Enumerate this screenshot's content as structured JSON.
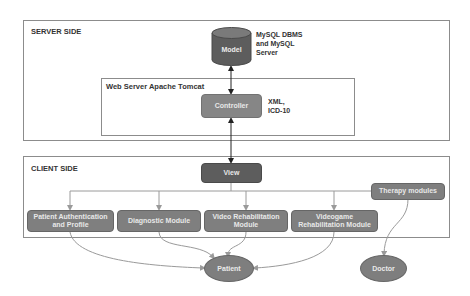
{
  "server": {
    "label": "SERVER SIDE",
    "web_server_label": "Web Server Apache Tomcat",
    "model": {
      "label": "Model",
      "note_lines": [
        "MySQL DBMS",
        "and MySQL",
        "Server"
      ]
    },
    "controller": {
      "label": "Controller",
      "note_lines": [
        "XML,",
        "ICD-10"
      ]
    }
  },
  "client": {
    "label": "CLIENT SIDE",
    "view": {
      "label": "View"
    },
    "therapy": {
      "label": "Therapy modules"
    },
    "modules": [
      {
        "label_lines": [
          "Patient Authentication",
          "and Profile"
        ]
      },
      {
        "label_lines": [
          "Diagnostic Module"
        ]
      },
      {
        "label_lines": [
          "Video Rehabilitation",
          "Module"
        ]
      },
      {
        "label_lines": [
          "Videogame",
          "Rehabilitation Module"
        ]
      }
    ]
  },
  "actors": {
    "patient": "Patient",
    "doctor": "Doctor"
  },
  "colors": {
    "dark_node": "#5d5d5d",
    "mid_node": "#868686",
    "module_node": "#7f7f7f",
    "actor": "#7e7e7e",
    "frame_border": "#8c8c8c",
    "arrow_dark": "#222222",
    "arrow_light": "#9a9a9a"
  }
}
